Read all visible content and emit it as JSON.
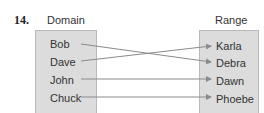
{
  "problem_number": "14.",
  "domain": {
    "title": "Domain",
    "items": [
      "Bob",
      "Dave",
      "John",
      "Chuck"
    ]
  },
  "range": {
    "title": "Range",
    "items": [
      "Karla",
      "Debra",
      "Dawn",
      "Phoebe"
    ]
  },
  "mapping": [
    {
      "from": "Bob",
      "to": "Debra"
    },
    {
      "from": "Dave",
      "to": "Karla"
    },
    {
      "from": "John",
      "to": "Dawn"
    },
    {
      "from": "Chuck",
      "to": "Phoebe"
    }
  ],
  "colors": {
    "box_fill": "#dcdcdc",
    "arrow": "#8a8a8a"
  }
}
